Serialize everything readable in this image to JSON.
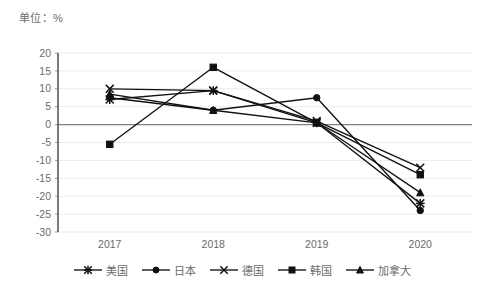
{
  "unit_label": "单位：%",
  "chart_data": {
    "type": "line",
    "title": "",
    "subtitle": "",
    "xlabel": "",
    "ylabel": "",
    "unit": "%",
    "categories": [
      "2017",
      "2018",
      "2019",
      "2020"
    ],
    "ylim": [
      -30,
      20
    ],
    "ytick_values": [
      20,
      15,
      10,
      5,
      0,
      -5,
      -10,
      -15,
      -20,
      -25,
      -30
    ],
    "ytick_labels": [
      "20",
      "15",
      "10",
      "5",
      "0",
      "-5",
      "-10",
      "-15",
      "-20",
      "-25",
      "-30"
    ],
    "grid": true,
    "legend_position": "bottom",
    "zero_line": 0,
    "series": [
      {
        "name": "美国",
        "marker": "star",
        "color": "#111111",
        "values": [
          7.0,
          9.5,
          0.5,
          -22.0
        ]
      },
      {
        "name": "日本",
        "marker": "circle",
        "color": "#111111",
        "values": [
          7.5,
          4.0,
          7.5,
          -24.0
        ]
      },
      {
        "name": "德国",
        "marker": "x",
        "color": "#111111",
        "values": [
          10.0,
          9.5,
          1.0,
          -12.0
        ]
      },
      {
        "name": "韩国",
        "marker": "square",
        "color": "#111111",
        "values": [
          -5.5,
          16.0,
          0.5,
          -14.0
        ]
      },
      {
        "name": "加拿大",
        "marker": "triangle",
        "color": "#111111",
        "values": [
          8.5,
          4.0,
          0.5,
          -19.0
        ]
      }
    ]
  },
  "legend": {
    "items": [
      {
        "label": "美国",
        "marker": "star"
      },
      {
        "label": "日本",
        "marker": "circle"
      },
      {
        "label": "德国",
        "marker": "x"
      },
      {
        "label": "韩国",
        "marker": "square"
      },
      {
        "label": "加拿大",
        "marker": "triangle"
      }
    ]
  }
}
